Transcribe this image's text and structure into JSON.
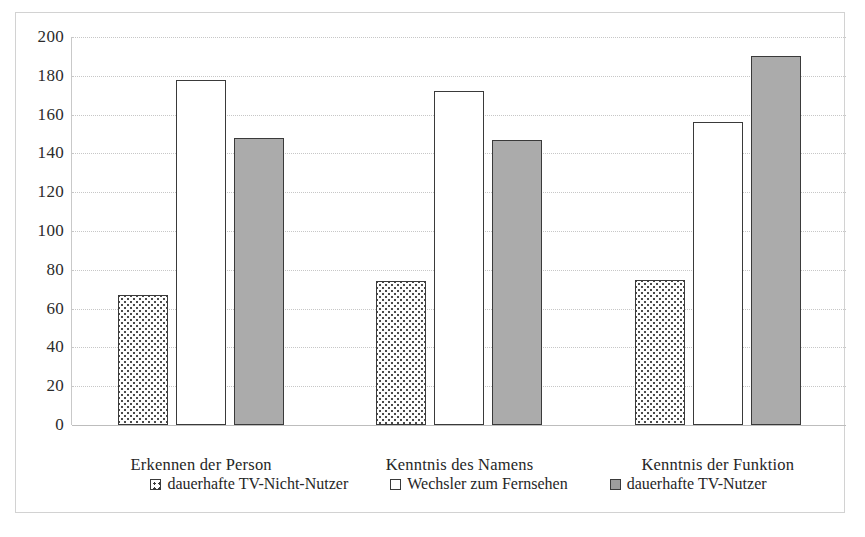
{
  "chart_data": {
    "type": "bar",
    "title": "",
    "subtitle": "",
    "xlabel": "",
    "ylabel": "",
    "categories": [
      "Erkennen der Person",
      "Kenntnis des Namens",
      "Kenntnis der Funktion"
    ],
    "series": [
      {
        "name": "dauerhafte TV-Nicht-Nutzer",
        "values": [
          67,
          74,
          75
        ],
        "fill": "dotted",
        "marker": "dotted-square"
      },
      {
        "name": "Wechsler zum Fernsehen",
        "values": [
          178,
          172,
          156
        ],
        "fill": "white",
        "marker": "white-square"
      },
      {
        "name": "dauerhafte TV-Nutzer",
        "values": [
          148,
          147,
          190
        ],
        "fill": "gray",
        "marker": "gray-square"
      }
    ],
    "ylim": [
      0,
      200
    ],
    "ytick_step": 20,
    "yticks": [
      200,
      180,
      160,
      140,
      120,
      100,
      80,
      60,
      40,
      20,
      0
    ],
    "grid": true,
    "grid_axis": "y",
    "legend_position": "bottom",
    "colors": {
      "bar_outline": "#3a3a3a",
      "bar_gray_fill": "#ababab",
      "bar_white_fill": "#ffffff",
      "gridline": "#c7c7c7",
      "axis": "#bdbdbd",
      "frame": "#d2d2d2",
      "text": "#262626",
      "background": "#ffffff"
    }
  }
}
